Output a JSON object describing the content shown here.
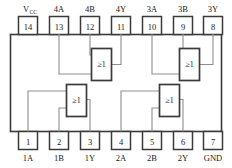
{
  "diagram": {
    "package": {
      "pin_count": 14,
      "body_fill": "#ffffff",
      "body_stroke": "#3b3b3b",
      "wire_color": "#8a8a8a",
      "text_color": "#1a1a1a"
    },
    "gate_symbol": "≥1",
    "pins_top": [
      {
        "number": "14",
        "label": "V",
        "label_sub": "CC",
        "label_kind": "supply"
      },
      {
        "number": "13",
        "label": "4A",
        "label_sub": "",
        "label_kind": "plain"
      },
      {
        "number": "12",
        "label": "4B",
        "label_sub": "",
        "label_kind": "plain"
      },
      {
        "number": "11",
        "label": "4Y",
        "label_sub": "",
        "label_kind": "plain"
      },
      {
        "number": "10",
        "label": "3A",
        "label_sub": "",
        "label_kind": "plain"
      },
      {
        "number": "9",
        "label": "3B",
        "label_sub": "",
        "label_kind": "plain"
      },
      {
        "number": "8",
        "label": "3Y",
        "label_sub": "",
        "label_kind": "plain"
      }
    ],
    "pins_bottom": [
      {
        "number": "1",
        "label": "1A",
        "label_sub": "",
        "label_kind": "plain"
      },
      {
        "number": "2",
        "label": "1B",
        "label_sub": "",
        "label_kind": "plain"
      },
      {
        "number": "3",
        "label": "1Y",
        "label_sub": "",
        "label_kind": "plain"
      },
      {
        "number": "4",
        "label": "2A",
        "label_sub": "",
        "label_kind": "plain"
      },
      {
        "number": "5",
        "label": "2B",
        "label_sub": "",
        "label_kind": "plain"
      },
      {
        "number": "6",
        "label": "2Y",
        "label_sub": "",
        "label_kind": "plain"
      },
      {
        "number": "7",
        "label": "GND",
        "label_sub": "",
        "label_kind": "plain"
      }
    ],
    "gates": [
      {
        "id": "gate-1",
        "name": "gate-1",
        "inputs": [
          "1A",
          "1B"
        ],
        "output": "1Y",
        "symbol": "≥1"
      },
      {
        "id": "gate-2",
        "name": "gate-2",
        "inputs": [
          "2A",
          "2B"
        ],
        "output": "2Y",
        "symbol": "≥1"
      },
      {
        "id": "gate-3",
        "name": "gate-3",
        "inputs": [
          "3A",
          "3B"
        ],
        "output": "3Y",
        "symbol": "≥1"
      },
      {
        "id": "gate-4",
        "name": "gate-4",
        "inputs": [
          "4A",
          "4B"
        ],
        "output": "4Y",
        "symbol": "≥1"
      }
    ]
  }
}
